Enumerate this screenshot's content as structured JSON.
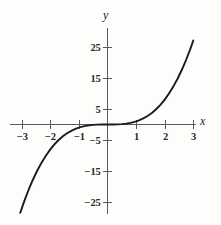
{
  "chart_data": {
    "type": "line",
    "title": "",
    "subtitle": "",
    "xlabel": "x",
    "ylabel": "y",
    "xlim": [
      -3.3,
      3.3
    ],
    "ylim": [
      -28,
      28
    ],
    "grid": false,
    "legend": null,
    "function_label": "y = x^3",
    "xticks": [
      -3,
      -2,
      -1,
      1,
      2,
      3
    ],
    "xtick_labels": [
      "−3",
      "−2",
      "−1",
      "1",
      "2",
      "3"
    ],
    "yticks": [
      25,
      15,
      5,
      -5,
      -15,
      -25
    ],
    "ytick_labels": [
      "25",
      "15",
      "5",
      "−5",
      "−15",
      "−25"
    ],
    "series": [
      {
        "name": "y = x^3",
        "x": [
          -3.05,
          -2.9,
          -2.75,
          -2.6,
          -2.45,
          -2.3,
          -2.15,
          -2.0,
          -1.85,
          -1.7,
          -1.55,
          -1.4,
          -1.25,
          -1.1,
          -0.95,
          -0.8,
          -0.65,
          -0.5,
          -0.35,
          -0.2,
          0.0,
          0.2,
          0.35,
          0.5,
          0.65,
          0.8,
          0.95,
          1.1,
          1.25,
          1.4,
          1.55,
          1.7,
          1.85,
          2.0,
          2.15,
          2.3,
          2.45,
          2.6,
          2.75,
          2.9,
          3.0
        ],
        "y": [
          -28.37,
          -24.39,
          -20.8,
          -17.58,
          -14.71,
          -12.17,
          -9.94,
          -8.0,
          -6.33,
          -4.91,
          -3.72,
          -2.74,
          -1.95,
          -1.33,
          -0.86,
          -0.51,
          -0.27,
          -0.13,
          -0.04,
          -0.01,
          0.0,
          0.01,
          0.04,
          0.13,
          0.27,
          0.51,
          0.86,
          1.33,
          1.95,
          2.74,
          3.72,
          4.91,
          6.33,
          8.0,
          9.94,
          12.17,
          14.71,
          17.58,
          20.8,
          24.39,
          27.0
        ]
      }
    ],
    "colors": {
      "curve": "#1b1b1b",
      "axis": "#5a5a5a",
      "background": "#fdfdfc",
      "text": "#2a2a2a"
    }
  },
  "axis_labels": {
    "x": "x",
    "y": "y"
  }
}
